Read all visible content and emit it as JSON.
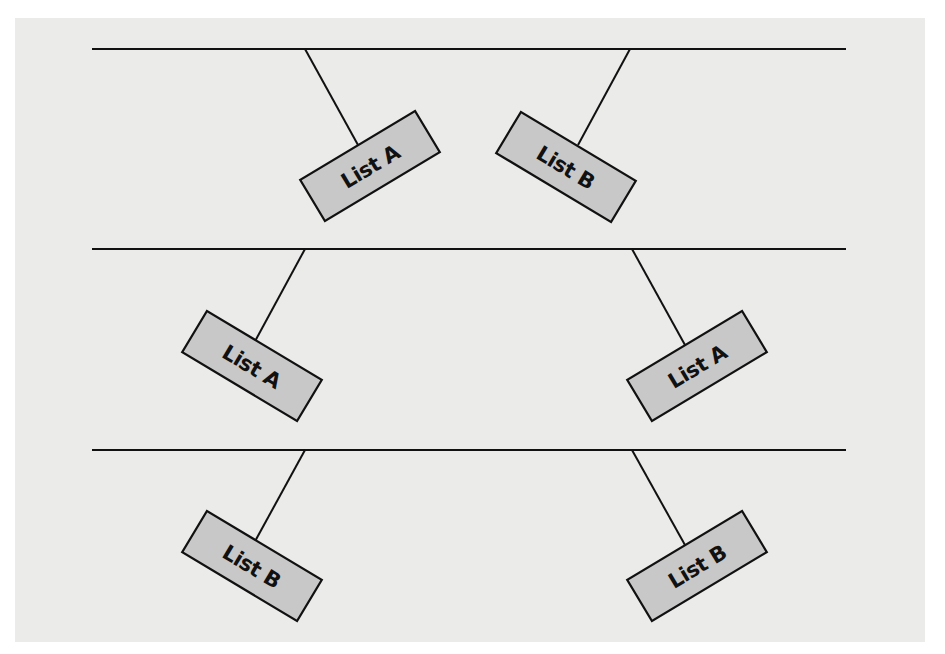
{
  "colors": {
    "page_background": "#ffffff",
    "panel_background": "#ebebea",
    "line": "#111111",
    "box_fill": "#c8c8c8",
    "box_stroke": "#111111",
    "label_text": "#111111"
  },
  "diagram": {
    "rows": [
      {
        "name": "row-1",
        "line": {
          "x1": 92,
          "x2": 846,
          "y": 49
        },
        "boxes": [
          {
            "label": "List A",
            "anchor_x": 305,
            "cx": 370,
            "cy": 166,
            "angle": -31,
            "side": "left"
          },
          {
            "label": "List B",
            "anchor_x": 630,
            "cx": 566,
            "cy": 167,
            "angle": 31,
            "side": "right"
          }
        ]
      },
      {
        "name": "row-2",
        "line": {
          "x1": 92,
          "x2": 846,
          "y": 249
        },
        "boxes": [
          {
            "label": "List A",
            "anchor_x": 305,
            "cx": 252,
            "cy": 366,
            "angle": 31,
            "side": "left"
          },
          {
            "label": "List A",
            "anchor_x": 632,
            "cx": 697,
            "cy": 366,
            "angle": -31,
            "side": "right"
          }
        ]
      },
      {
        "name": "row-3",
        "line": {
          "x1": 92,
          "x2": 846,
          "y": 450
        },
        "boxes": [
          {
            "label": "List B",
            "anchor_x": 305,
            "cx": 252,
            "cy": 566,
            "angle": 31,
            "side": "left"
          },
          {
            "label": "List B",
            "anchor_x": 632,
            "cx": 697,
            "cy": 566,
            "angle": -31,
            "side": "right"
          }
        ]
      }
    ],
    "box_size": {
      "width": 134,
      "height": 48
    }
  },
  "labels": {
    "r1_left": "List A",
    "r1_right": "List B",
    "r2_left": "List A",
    "r2_right": "List A",
    "r3_left": "List B",
    "r3_right": "List B"
  }
}
